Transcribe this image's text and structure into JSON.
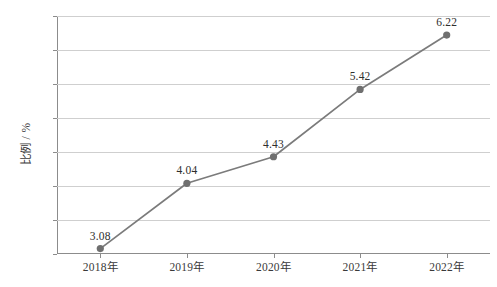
{
  "chart_data": {
    "type": "line",
    "title": "",
    "xlabel": "",
    "ylabel": "比例 / %",
    "categories": [
      "2018年",
      "2019年",
      "2020年",
      "2021年",
      "2022年"
    ],
    "values": [
      3.08,
      4.04,
      4.43,
      5.42,
      6.22
    ],
    "point_labels": [
      "3.08",
      "4.04",
      "4.43",
      "5.42",
      "6.22"
    ],
    "ylim": [
      3.0,
      6.5
    ],
    "yticks": [
      3.0,
      3.5,
      4.0,
      4.5,
      5.0,
      5.5,
      6.0,
      6.5
    ],
    "ytick_labels": [
      "3.0",
      "3.5",
      "4.0",
      "4.5",
      "5.0",
      "5.5",
      "6.0",
      "6.5"
    ],
    "grid": "horizontal",
    "legend": "none",
    "series": [
      {
        "name": "比例",
        "values": [
          3.08,
          4.04,
          4.43,
          5.42,
          6.22
        ]
      }
    ],
    "colors": {
      "line": "#7b7b7b",
      "marker": "#6f6f6f",
      "gridline": "#cfcfcf",
      "axis": "#8c8c8c",
      "text": "#3a3a3a",
      "background": "#ffffff"
    }
  }
}
